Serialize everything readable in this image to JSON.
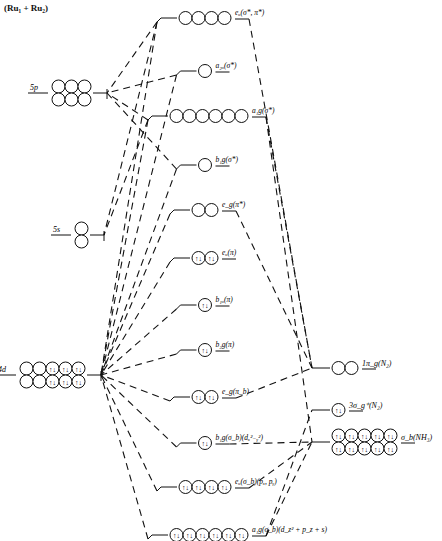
{
  "title": "(Ru₁ + Ru₂)",
  "left_levels": [
    {
      "id": "5p",
      "label": "5p",
      "y": 93,
      "rows": 2,
      "cols": 3,
      "filled": 0
    },
    {
      "id": "5s",
      "label": "5s",
      "y": 235,
      "rows": 2,
      "cols": 1,
      "filled": 0
    },
    {
      "id": "4d",
      "label": "4d",
      "y": 375,
      "rows": 2,
      "cols": 5,
      "filled": 6
    }
  ],
  "mo_levels": [
    {
      "id": "eu_sigma_pi_star",
      "label": "eᵤ(σ*, π*)",
      "y": 18,
      "n": 4,
      "filled": false
    },
    {
      "id": "a2u_sigma_star",
      "label": "a₂ᵤ(σ*)",
      "y": 71,
      "n": 1,
      "filled": false
    },
    {
      "id": "a1g_sigma_star",
      "label": "a₁g(σ*)",
      "y": 116,
      "n": 6,
      "filled": false
    },
    {
      "id": "b1g_sigma_star",
      "label": "b₁g(σ*)",
      "y": 165,
      "n": 1,
      "filled": false
    },
    {
      "id": "eg_pi_star",
      "label": "e_g(π*)",
      "y": 210,
      "n": 2,
      "filled": false
    },
    {
      "id": "eu_pi",
      "label": "eᵤ(π)",
      "y": 258,
      "n": 2,
      "filled": true
    },
    {
      "id": "b1u_pi",
      "label": "b₁ᵤ(π)",
      "y": 305,
      "n": 1,
      "filled": true
    },
    {
      "id": "b2g_pi",
      "label": "b₂g(π)",
      "y": 350,
      "n": 1,
      "filled": true
    },
    {
      "id": "eg_pib",
      "label": "e_g(π_b)",
      "y": 397,
      "n": 2,
      "filled": true
    },
    {
      "id": "b1g_sigmab",
      "label": "b₁g(σ_b)(dₓ²₋ᵧ²)",
      "y": 443,
      "n": 1,
      "filled": true
    },
    {
      "id": "eu_sigmab",
      "label": "eᵤ(σ_b)(pₓ, pᵧ)",
      "y": 487,
      "n": 4,
      "filled": true
    },
    {
      "id": "a1g_sigmab",
      "label": "a₁g(σ_b)(d_z² + p_z + s)",
      "y": 535,
      "n": 6,
      "filled": true
    }
  ],
  "right_levels": [
    {
      "id": "1pig_N2",
      "label": "1π_g(N₂)",
      "y": 368,
      "rows": 1,
      "cols": 2,
      "filled": 0
    },
    {
      "id": "3sigmag_N2",
      "label": "3σ_g⁺(N₂)",
      "y": 410,
      "rows": 1,
      "cols": 1,
      "filled": 1
    },
    {
      "id": "sigmab_NH3",
      "label": "σ_b(NH₃)",
      "y": 442,
      "rows": 2,
      "cols": 5,
      "filled": 10
    }
  ],
  "electron_glyph": "↑↓"
}
